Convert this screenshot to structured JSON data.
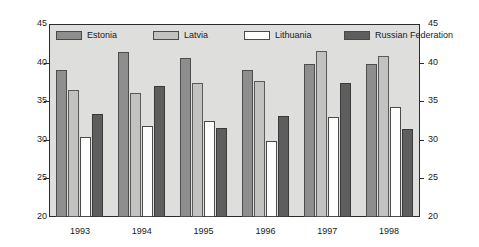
{
  "chart_data": {
    "type": "bar",
    "title": "",
    "subtitle": "",
    "xlabel": "",
    "ylabel": "",
    "ylim": [
      20,
      45
    ],
    "yticks": [
      20,
      25,
      30,
      35,
      40,
      45
    ],
    "grid": false,
    "legend_position": "top",
    "dual_axis": true,
    "categories": [
      "1993",
      "1994",
      "1995",
      "1996",
      "1997",
      "1998"
    ],
    "series": [
      {
        "name": "Estonia",
        "color": "#8e8e8e",
        "values": [
          39.1,
          41.4,
          40.6,
          39.1,
          39.8,
          39.8
        ]
      },
      {
        "name": "Latvia",
        "color": "#c2c2c0",
        "values": [
          36.4,
          36.1,
          37.3,
          37.6,
          41.5,
          40.9
        ]
      },
      {
        "name": "Lithuania",
        "color": "#fdfdfd",
        "values": [
          30.4,
          31.8,
          32.5,
          29.9,
          32.9,
          34.3
        ]
      },
      {
        "name": "Russian Federation",
        "color": "#5e5e5e",
        "values": [
          33.4,
          37.0,
          31.5,
          33.1,
          37.3,
          31.4
        ]
      }
    ],
    "axis_left_ticks": [
      "45",
      "40",
      "35",
      "30",
      "25",
      "20"
    ],
    "axis_right_ticks": [
      "45",
      "40",
      "35",
      "30",
      "25",
      "20"
    ]
  },
  "colors": {
    "plot_background": "#dededc",
    "page_background": "#ffffff",
    "axis": "#2b2b2b",
    "text": "#1a1a1a"
  }
}
